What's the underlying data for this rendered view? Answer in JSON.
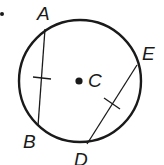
{
  "diagram": {
    "type": "circle-chords",
    "colors": {
      "stroke": "#1a1a1a",
      "background": "#ffffff"
    },
    "bullet": {
      "x": 2,
      "y": 14
    },
    "circle": {
      "cx": 80,
      "cy": 81,
      "r": 61,
      "center_label": "C"
    },
    "points": {
      "A": {
        "label": "A",
        "x": 45,
        "y": 29
      },
      "B": {
        "label": "B",
        "x": 38,
        "y": 126
      },
      "E": {
        "label": "E",
        "x": 137,
        "y": 65
      },
      "D": {
        "label": "D",
        "x": 87,
        "y": 144
      }
    },
    "chords": [
      {
        "from": "A",
        "to": "B",
        "congruence_tick": true
      },
      {
        "from": "E",
        "to": "D",
        "congruence_tick": true
      }
    ]
  }
}
